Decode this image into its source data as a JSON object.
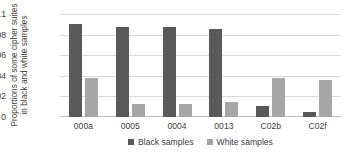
{
  "chart_data": {
    "type": "bar",
    "title": "",
    "subtitle": "",
    "xlabel": "",
    "ylabel": "Proportions of some cipher suites in black and white samples",
    "categories": [
      "000a",
      "0005",
      "0004",
      "0013",
      "C02b",
      "C02f"
    ],
    "series": [
      {
        "name": "Black samples",
        "color": "#595959",
        "values": [
          0.0905,
          0.0875,
          0.0878,
          0.0852,
          0.0107,
          0.0053
        ]
      },
      {
        "name": "White samples",
        "color": "#a6a6a6",
        "values": [
          0.0377,
          0.0128,
          0.0127,
          0.015,
          0.0383,
          0.0355
        ]
      }
    ],
    "ylim": [
      0,
      0.1
    ],
    "yticks": [
      0,
      0.02,
      0.04,
      0.06,
      0.08,
      0.1
    ],
    "ytick_labels": [
      "0",
      "0.02",
      "0.04",
      "0.06",
      "0.08",
      "0.1"
    ],
    "grid": true,
    "grid_axis": "y",
    "legend_position": "bottom",
    "legend": [
      "Black samples",
      "White samples"
    ],
    "background_color": "#ffffff",
    "gridline_color": "#d9d9d9",
    "axis_text_color": "#404040"
  }
}
